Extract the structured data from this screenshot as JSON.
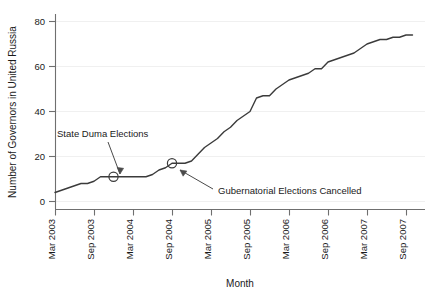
{
  "chart_data": {
    "type": "line",
    "title": "",
    "xlabel": "Month",
    "ylabel": "Number of Governors in United Russia",
    "grid": true,
    "legend": "none",
    "xlim": [
      "Mar 2003",
      "Sep 2007"
    ],
    "ylim": [
      0,
      80
    ],
    "yticks": [
      "0",
      "20",
      "40",
      "60",
      "80"
    ],
    "ytick_values": [
      0,
      20,
      40,
      60,
      80
    ],
    "xticks": [
      "Mar 2003",
      "Sep 2003",
      "Mar 2004",
      "Sep 2004",
      "Mar 2005",
      "Sep 2005",
      "Mar 2006",
      "Sep 2006",
      "Mar 2007",
      "Sep 2007"
    ],
    "x": [
      "Mar 2003",
      "Apr 2003",
      "May 2003",
      "Jun 2003",
      "Jul 2003",
      "Aug 2003",
      "Sep 2003",
      "Oct 2003",
      "Nov 2003",
      "Dec 2003",
      "Jan 2004",
      "Feb 2004",
      "Mar 2004",
      "Apr 2004",
      "May 2004",
      "Jun 2004",
      "Jul 2004",
      "Aug 2004",
      "Sep 2004",
      "Oct 2004",
      "Nov 2004",
      "Dec 2004",
      "Jan 2005",
      "Feb 2005",
      "Mar 2005",
      "Apr 2005",
      "May 2005",
      "Jun 2005",
      "Jul 2005",
      "Aug 2005",
      "Sep 2005",
      "Oct 2005",
      "Nov 2005",
      "Dec 2005",
      "Jan 2006",
      "Feb 2006",
      "Mar 2006",
      "Apr 2006",
      "May 2006",
      "Jun 2006",
      "Jul 2006",
      "Aug 2006",
      "Sep 2006",
      "Oct 2006",
      "Nov 2006",
      "Dec 2006",
      "Jan 2007",
      "Feb 2007",
      "Mar 2007",
      "Apr 2007",
      "May 2007",
      "Jun 2007",
      "Jul 2007",
      "Aug 2007",
      "Sep 2007",
      "Oct 2007"
    ],
    "values": [
      4,
      5,
      6,
      7,
      8,
      8,
      9,
      11,
      11,
      11,
      11,
      11,
      11,
      11,
      11,
      12,
      14,
      15,
      17,
      17,
      17,
      18,
      21,
      24,
      26,
      28,
      31,
      33,
      36,
      38,
      40,
      46,
      47,
      47,
      50,
      52,
      54,
      55,
      56,
      57,
      59,
      59,
      62,
      63,
      64,
      65,
      66,
      68,
      70,
      71,
      72,
      72,
      73,
      73,
      74,
      74
    ],
    "series": [
      {
        "name": "Governors in United Russia",
        "values": [
          4,
          5,
          6,
          7,
          8,
          8,
          9,
          11,
          11,
          11,
          11,
          11,
          11,
          11,
          11,
          12,
          14,
          15,
          17,
          17,
          17,
          18,
          21,
          24,
          26,
          28,
          31,
          33,
          36,
          38,
          40,
          46,
          47,
          47,
          50,
          52,
          54,
          55,
          56,
          57,
          59,
          59,
          62,
          63,
          64,
          65,
          66,
          68,
          70,
          71,
          72,
          72,
          73,
          73,
          74,
          74
        ]
      }
    ],
    "annotations": [
      {
        "label": "State Duma Elections",
        "marker_x": "Dec 2003",
        "marker_y": 11,
        "marker_shape": "circle-open"
      },
      {
        "label": "Gubernatorial Elections Cancelled",
        "marker_x": "Sep 2004",
        "marker_y": 17,
        "marker_shape": "circle-open"
      }
    ],
    "colors": {
      "line": "#3b3b3b",
      "axis": "#6f6f6f",
      "grid": "#f0f0f0",
      "text": "#1a1a1a",
      "background": "#ffffff"
    }
  }
}
